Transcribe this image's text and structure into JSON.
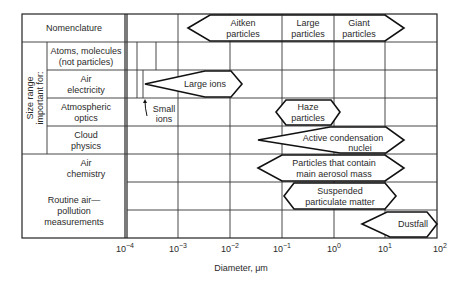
{
  "header": {
    "nomenclature_label": "Nomenclature"
  },
  "side_label": {
    "line1": "Size range",
    "line2": "important for:"
  },
  "rows": [
    {
      "label_lines": [
        "Atoms, molecules",
        "(not particles)"
      ]
    },
    {
      "label_lines": [
        "Air",
        "electricity"
      ]
    },
    {
      "label_lines": [
        "Atmospheric",
        "optics"
      ]
    },
    {
      "label_lines": [
        "Cloud",
        "physics"
      ]
    },
    {
      "label_lines": [
        "Air",
        "chemistry"
      ]
    },
    {
      "label_lines": [
        "Routine air—",
        "pollution",
        "measurements"
      ]
    }
  ],
  "ranges": {
    "aitken": [
      "Aitken",
      "particles"
    ],
    "large": [
      "Large",
      "particles"
    ],
    "giant": [
      "Giant",
      "particles"
    ],
    "large_ions": [
      "Large ions"
    ],
    "small_ions": [
      "Small",
      "ions"
    ],
    "haze": [
      "Haze",
      "particles"
    ],
    "condensation": [
      "Active condensation",
      "nuclei"
    ],
    "aerosol_mass": [
      "Particles that contain",
      "main aerosol mass"
    ],
    "suspended": [
      "Suspended",
      "particulate matter"
    ],
    "dustfall": [
      "Dustfall"
    ]
  },
  "axis": {
    "ticks": [
      {
        "base": "10",
        "exp": "−4"
      },
      {
        "base": "10",
        "exp": "−3"
      },
      {
        "base": "10",
        "exp": "−2"
      },
      {
        "base": "10",
        "exp": "−1"
      },
      {
        "base": "10",
        "exp": "0"
      },
      {
        "base": "10",
        "exp": "1"
      },
      {
        "base": "10",
        "exp": "2"
      }
    ],
    "label": "Diameter, μm"
  }
}
